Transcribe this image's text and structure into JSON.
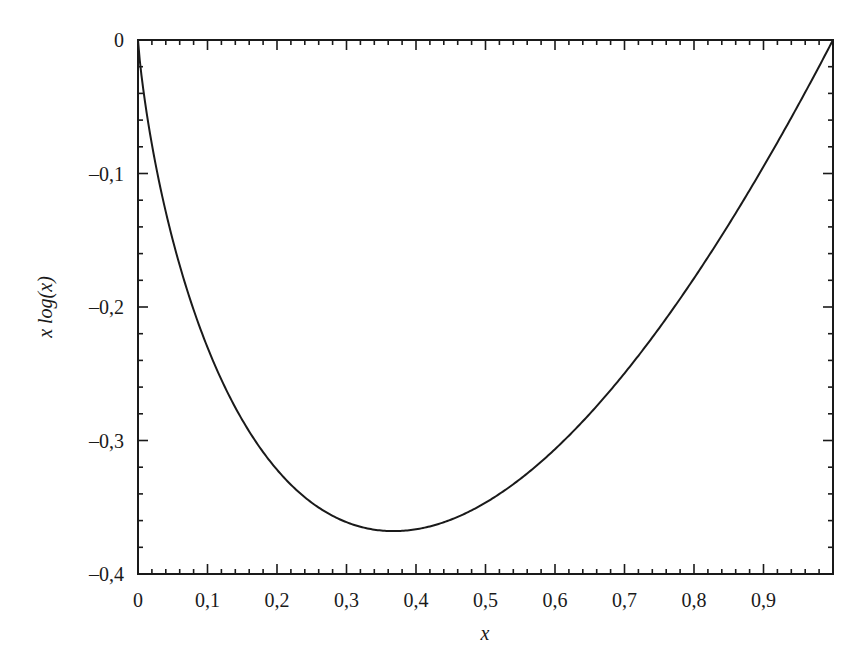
{
  "chart_data": {
    "type": "line",
    "title": "",
    "xlabel": "x",
    "ylabel": "x log(x)",
    "xlim": [
      0,
      1
    ],
    "ylim": [
      -0.4,
      0
    ],
    "grid": false,
    "legend": null,
    "x_ticks": [
      "0",
      "0,1",
      "0,2",
      "0,3",
      "0,4",
      "0,5",
      "0,6",
      "0,7",
      "0,8",
      "0,9"
    ],
    "y_ticks": [
      "0",
      "–0,1",
      "–0,2",
      "–0,3",
      "–0,4"
    ],
    "series": [
      {
        "name": "x log(x)",
        "function": "x*ln(x)",
        "x": [
          0.0,
          0.01,
          0.02,
          0.05,
          0.1,
          0.15,
          0.2,
          0.25,
          0.3,
          0.35,
          0.3679,
          0.4,
          0.45,
          0.5,
          0.55,
          0.6,
          0.65,
          0.7,
          0.75,
          0.8,
          0.85,
          0.9,
          0.95,
          1.0
        ],
        "y": [
          0.0,
          -0.046,
          -0.078,
          -0.15,
          -0.23,
          -0.285,
          -0.322,
          -0.347,
          -0.361,
          -0.367,
          -0.368,
          -0.367,
          -0.359,
          -0.347,
          -0.329,
          -0.306,
          -0.28,
          -0.25,
          -0.216,
          -0.179,
          -0.138,
          -0.095,
          -0.049,
          0.0
        ]
      }
    ],
    "annotations": []
  },
  "plot": {
    "line_color": "#1a1a1a",
    "frame_color": "#1a1a1a"
  }
}
